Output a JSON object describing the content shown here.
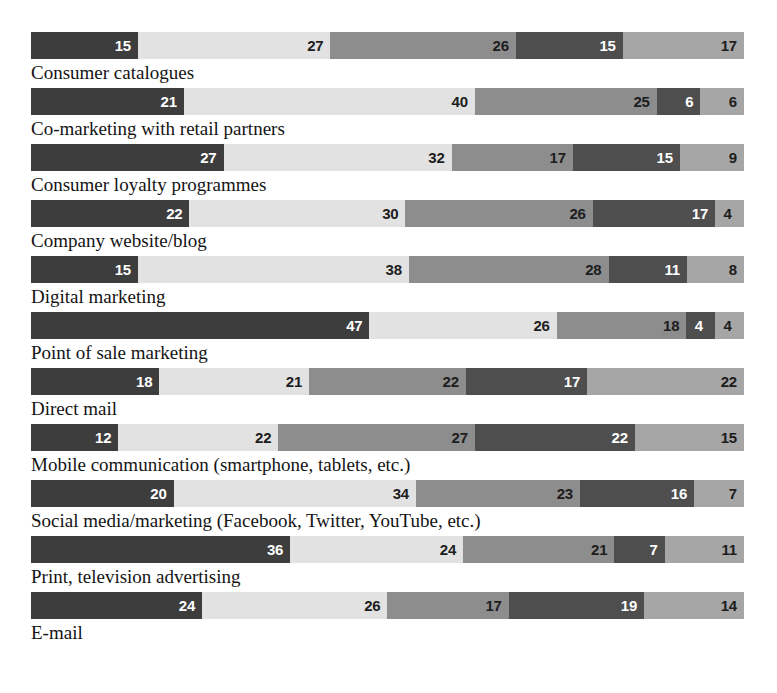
{
  "chart": {
    "cut_off_title": "",
    "value_suffix": ""
  },
  "chart_data": {
    "type": "bar",
    "subtype": "horizontal-stacked-100",
    "title": "",
    "xlabel": "",
    "ylabel": "",
    "xlim": [
      0,
      100
    ],
    "grid": false,
    "legend_position": "none",
    "orientation": "horizontal",
    "stacked": true,
    "categories": [
      "Consumer catalogues",
      "Co-marketing with retail partners",
      "Consumer loyalty programmes",
      "Company website/blog",
      "Digital marketing",
      "Point of sale marketing",
      "Direct mail",
      "Mobile communication (smartphone, tablets, etc.)",
      "Social media/marketing (Facebook, Twitter, YouTube, etc.)",
      "Print, television advertising",
      "E-mail"
    ],
    "series": [
      {
        "name": "segment-1",
        "color": "#3d3d3d",
        "values": [
          15,
          21,
          27,
          22,
          15,
          47,
          18,
          12,
          20,
          36,
          24
        ]
      },
      {
        "name": "segment-2",
        "color": "#e2e2e2",
        "values": [
          27,
          40,
          32,
          30,
          38,
          26,
          21,
          22,
          34,
          24,
          26
        ]
      },
      {
        "name": "segment-3",
        "color": "#8d8d8d",
        "values": [
          26,
          25,
          17,
          26,
          28,
          18,
          22,
          27,
          23,
          21,
          17
        ]
      },
      {
        "name": "segment-4",
        "color": "#4e4e4e",
        "values": [
          15,
          6,
          15,
          17,
          11,
          4,
          17,
          22,
          16,
          7,
          19
        ]
      },
      {
        "name": "segment-5",
        "color": "#a6a6a6",
        "values": [
          17,
          6,
          9,
          4,
          8,
          4,
          22,
          15,
          7,
          11,
          14
        ]
      }
    ],
    "rows": [
      {
        "label": "Consumer catalogues",
        "segments": [
          {
            "value": 15,
            "text": "15",
            "color": "#3d3d3d",
            "text_color": "light"
          },
          {
            "value": 27,
            "text": "27",
            "color": "#e2e2e2",
            "text_color": "dark"
          },
          {
            "value": 26,
            "text": "26",
            "color": "#8d8d8d",
            "text_color": "dark"
          },
          {
            "value": 15,
            "text": "15",
            "color": "#4e4e4e",
            "text_color": "light"
          },
          {
            "value": 17,
            "text": "17",
            "color": "#a6a6a6",
            "text_color": "dark"
          }
        ]
      },
      {
        "label": "Co-marketing with retail partners",
        "segments": [
          {
            "value": 21,
            "text": "21",
            "color": "#3d3d3d",
            "text_color": "light"
          },
          {
            "value": 40,
            "text": "40",
            "color": "#e2e2e2",
            "text_color": "dark"
          },
          {
            "value": 25,
            "text": "25",
            "color": "#8d8d8d",
            "text_color": "dark"
          },
          {
            "value": 6,
            "text": "6",
            "color": "#4e4e4e",
            "text_color": "light"
          },
          {
            "value": 6,
            "text": "6",
            "color": "#a6a6a6",
            "text_color": "dark"
          }
        ]
      },
      {
        "label": "Consumer loyalty programmes",
        "segments": [
          {
            "value": 27,
            "text": "27",
            "color": "#3d3d3d",
            "text_color": "light"
          },
          {
            "value": 32,
            "text": "32",
            "color": "#e2e2e2",
            "text_color": "dark"
          },
          {
            "value": 17,
            "text": "17",
            "color": "#8d8d8d",
            "text_color": "dark"
          },
          {
            "value": 15,
            "text": "15",
            "color": "#4e4e4e",
            "text_color": "light"
          },
          {
            "value": 9,
            "text": "9",
            "color": "#a6a6a6",
            "text_color": "dark"
          }
        ]
      },
      {
        "label": "Company website/blog",
        "segments": [
          {
            "value": 22,
            "text": "22",
            "color": "#3d3d3d",
            "text_color": "light"
          },
          {
            "value": 30,
            "text": "30",
            "color": "#e2e2e2",
            "text_color": "dark"
          },
          {
            "value": 26,
            "text": "26",
            "color": "#8d8d8d",
            "text_color": "dark"
          },
          {
            "value": 17,
            "text": "17",
            "color": "#4e4e4e",
            "text_color": "light"
          },
          {
            "value": 4,
            "text": "4",
            "color": "#a6a6a6",
            "text_color": "dark"
          }
        ]
      },
      {
        "label": "Digital marketing",
        "segments": [
          {
            "value": 15,
            "text": "15",
            "color": "#3d3d3d",
            "text_color": "light"
          },
          {
            "value": 38,
            "text": "38",
            "color": "#e2e2e2",
            "text_color": "dark"
          },
          {
            "value": 28,
            "text": "28",
            "color": "#8d8d8d",
            "text_color": "dark"
          },
          {
            "value": 11,
            "text": "11",
            "color": "#4e4e4e",
            "text_color": "light"
          },
          {
            "value": 8,
            "text": "8",
            "color": "#a6a6a6",
            "text_color": "dark"
          }
        ]
      },
      {
        "label": "Point of sale marketing",
        "segments": [
          {
            "value": 47,
            "text": "47",
            "color": "#3d3d3d",
            "text_color": "light"
          },
          {
            "value": 26,
            "text": "26",
            "color": "#e2e2e2",
            "text_color": "dark"
          },
          {
            "value": 18,
            "text": "18",
            "color": "#8d8d8d",
            "text_color": "dark"
          },
          {
            "value": 4,
            "text": "4",
            "color": "#4e4e4e",
            "text_color": "light"
          },
          {
            "value": 4,
            "text": "4",
            "color": "#a6a6a6",
            "text_color": "dark"
          }
        ]
      },
      {
        "label": "Direct mail",
        "segments": [
          {
            "value": 18,
            "text": "18",
            "color": "#3d3d3d",
            "text_color": "light"
          },
          {
            "value": 21,
            "text": "21",
            "color": "#e2e2e2",
            "text_color": "dark"
          },
          {
            "value": 22,
            "text": "22",
            "color": "#8d8d8d",
            "text_color": "dark"
          },
          {
            "value": 17,
            "text": "17",
            "color": "#4e4e4e",
            "text_color": "light"
          },
          {
            "value": 22,
            "text": "22",
            "color": "#a6a6a6",
            "text_color": "dark"
          }
        ]
      },
      {
        "label": "Mobile communication (smartphone, tablets, etc.)",
        "segments": [
          {
            "value": 12,
            "text": "12",
            "color": "#3d3d3d",
            "text_color": "light"
          },
          {
            "value": 22,
            "text": "22",
            "color": "#e2e2e2",
            "text_color": "dark"
          },
          {
            "value": 27,
            "text": "27",
            "color": "#8d8d8d",
            "text_color": "dark"
          },
          {
            "value": 22,
            "text": "22",
            "color": "#4e4e4e",
            "text_color": "light"
          },
          {
            "value": 15,
            "text": "15",
            "color": "#a6a6a6",
            "text_color": "dark"
          }
        ]
      },
      {
        "label": "Social media/marketing (Facebook, Twitter, YouTube, etc.)",
        "segments": [
          {
            "value": 20,
            "text": "20",
            "color": "#3d3d3d",
            "text_color": "light"
          },
          {
            "value": 34,
            "text": "34",
            "color": "#e2e2e2",
            "text_color": "dark"
          },
          {
            "value": 23,
            "text": "23",
            "color": "#8d8d8d",
            "text_color": "dark"
          },
          {
            "value": 16,
            "text": "16",
            "color": "#4e4e4e",
            "text_color": "light"
          },
          {
            "value": 7,
            "text": "7",
            "color": "#a6a6a6",
            "text_color": "dark"
          }
        ]
      },
      {
        "label": "Print, television advertising",
        "segments": [
          {
            "value": 36,
            "text": "36",
            "color": "#3d3d3d",
            "text_color": "light"
          },
          {
            "value": 24,
            "text": "24",
            "color": "#e2e2e2",
            "text_color": "dark"
          },
          {
            "value": 21,
            "text": "21",
            "color": "#8d8d8d",
            "text_color": "dark"
          },
          {
            "value": 7,
            "text": "7",
            "color": "#4e4e4e",
            "text_color": "light"
          },
          {
            "value": 11,
            "text": "11",
            "color": "#a6a6a6",
            "text_color": "dark"
          }
        ]
      },
      {
        "label": "E-mail",
        "segments": [
          {
            "value": 24,
            "text": "24",
            "color": "#3d3d3d",
            "text_color": "light"
          },
          {
            "value": 26,
            "text": "26",
            "color": "#e2e2e2",
            "text_color": "dark"
          },
          {
            "value": 17,
            "text": "17",
            "color": "#8d8d8d",
            "text_color": "dark"
          },
          {
            "value": 19,
            "text": "19",
            "color": "#4e4e4e",
            "text_color": "light"
          },
          {
            "value": 14,
            "text": "14",
            "color": "#a6a6a6",
            "text_color": "dark"
          }
        ]
      }
    ]
  }
}
